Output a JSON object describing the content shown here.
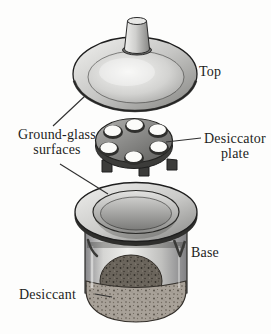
{
  "figure": {
    "labels": {
      "top": "Top",
      "ground_glass": "Ground-glass surfaces",
      "desiccator_plate": "Desiccator plate",
      "base": "Base",
      "desiccant": "Desiccant"
    },
    "colors": {
      "ink": "#1d1d1d",
      "background": "#fdfdfc",
      "glass_highlight": "#f2f2f0",
      "glass_mid": "#c6c6c4",
      "glass_shadow": "#82827f",
      "plate_top": "#838381",
      "plate_side": "#3c3c3a",
      "hole_rim": "#2f2f2d",
      "hole_fill": "#fbfbf9",
      "desiccant_dark": "#6b655c",
      "desiccant_light": "#a8a198"
    }
  }
}
